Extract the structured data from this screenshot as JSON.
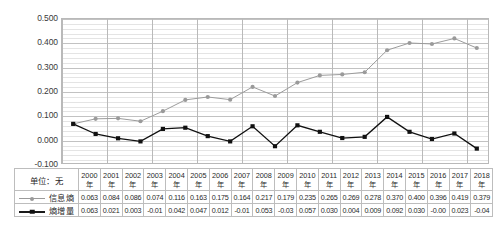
{
  "chart_data": {
    "type": "line",
    "title": "",
    "xlabel": "",
    "ylabel": "",
    "unit_label": "单位：无",
    "ylim": [
      -0.1,
      0.5
    ],
    "ytick_step": 0.1,
    "ytick_labels": [
      "0.500",
      "0.400",
      "0.300",
      "0.200",
      "0.100",
      "0.000",
      "-0.100"
    ],
    "ytick_values": [
      0.5,
      0.4,
      0.3,
      0.2,
      0.1,
      0.0,
      -0.1
    ],
    "grid": true,
    "grid_minor": true,
    "legend_position": "table-left",
    "categories": [
      "2000年",
      "2001年",
      "2002年",
      "2003年",
      "2004年",
      "2005年",
      "2006年",
      "2007年",
      "2008年",
      "2009年",
      "2010年",
      "2011年",
      "2012年",
      "2013年",
      "2014年",
      "2015年",
      "2016年",
      "2017年",
      "2018年"
    ],
    "x": [
      2000,
      2001,
      2002,
      2003,
      2004,
      2005,
      2006,
      2007,
      2008,
      2009,
      2010,
      2011,
      2012,
      2013,
      2014,
      2015,
      2016,
      2017,
      2018
    ],
    "series": [
      {
        "name": "信息熵",
        "color": "#9a9a9a",
        "marker": "circle",
        "values": [
          0.063,
          0.084,
          0.086,
          0.074,
          0.116,
          0.163,
          0.175,
          0.164,
          0.217,
          0.179,
          0.235,
          0.265,
          0.269,
          0.278,
          0.37,
          0.4,
          0.396,
          0.419,
          0.379
        ],
        "labels": [
          "0.063",
          "0.084",
          "0.086",
          "0.074",
          "0.116",
          "0.163",
          "0.175",
          "0.164",
          "0.217",
          "0.179",
          "0.235",
          "0.265",
          "0.269",
          "0.278",
          "0.370",
          "0.400",
          "0.396",
          "0.419",
          "0.379"
        ]
      },
      {
        "name": "熵增量",
        "color": "#111111",
        "marker": "square",
        "values": [
          0.063,
          0.021,
          0.003,
          -0.01,
          0.042,
          0.047,
          0.012,
          -0.01,
          0.053,
          -0.03,
          0.057,
          0.03,
          0.004,
          0.009,
          0.092,
          0.03,
          -0.0,
          0.023,
          -0.04
        ],
        "labels": [
          "0.063",
          "0.021",
          "0.003",
          "-0.01",
          "0.042",
          "0.047",
          "0.012",
          "-0.01",
          "0.053",
          "-0.03",
          "0.057",
          "0.030",
          "0.004",
          "0.009",
          "0.092",
          "0.030",
          "-0.00",
          "0.023",
          "-0.04"
        ]
      }
    ]
  },
  "table": {
    "unit_cell": "单位：无",
    "year_headers": [
      "2000\n年",
      "2001\n年",
      "2002\n年",
      "2003\n年",
      "2004\n年",
      "2005\n年",
      "2006\n年",
      "2007\n年",
      "2008\n年",
      "2009\n年",
      "2010\n年",
      "2011\n年",
      "2012\n年",
      "2013\n年",
      "2014\n年",
      "2015\n年",
      "2016\n年",
      "2017\n年",
      "2018\n年"
    ],
    "row_labels": [
      "信息熵",
      "熵增量"
    ]
  },
  "colors": {
    "series_entropy": "#9a9a9a",
    "series_increment": "#111111",
    "grid_major": "#c2c2c2",
    "grid_minor": "#e4e4e4",
    "axis_border": "#b9b9b9"
  }
}
